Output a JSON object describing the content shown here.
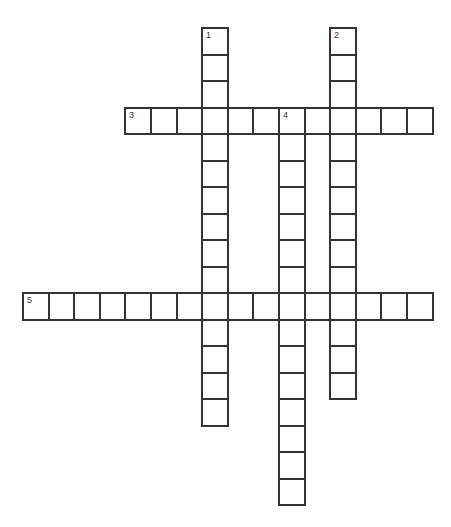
{
  "puzzle": {
    "type": "crossword",
    "grid": {
      "origin_x": 22,
      "origin_y": 27,
      "cell_w": 25.6,
      "cell_h": 26.5
    },
    "entries": [
      {
        "number": "1",
        "direction": "down",
        "col": 7,
        "row": 0,
        "length": 15
      },
      {
        "number": "2",
        "direction": "down",
        "col": 12,
        "row": 0,
        "length": 14
      },
      {
        "number": "3",
        "direction": "across",
        "col": 4,
        "row": 3,
        "length": 12
      },
      {
        "number": "4",
        "direction": "down",
        "col": 10,
        "row": 3,
        "length": 15
      },
      {
        "number": "5",
        "direction": "across",
        "col": 0,
        "row": 10,
        "length": 16
      }
    ],
    "colors": {
      "line": "#333333",
      "cell": "#ffffff",
      "number": "#333333"
    }
  }
}
